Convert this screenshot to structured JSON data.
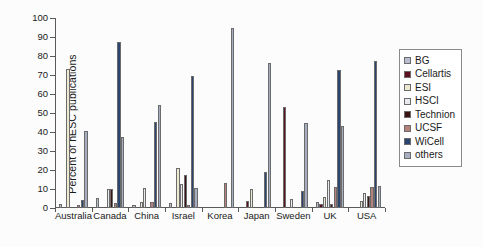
{
  "chart_data": {
    "type": "bar",
    "title": "",
    "xlabel": "",
    "ylabel": "Percent of hESC publications",
    "ylim": [
      0,
      100
    ],
    "ytick_step": 10,
    "yticks": [
      0,
      10,
      20,
      30,
      40,
      50,
      60,
      70,
      80,
      90,
      100
    ],
    "ytick_labels": [
      "0",
      "10",
      "20",
      "30",
      "40",
      "50",
      "60",
      "70",
      "80",
      "90",
      "100"
    ],
    "grid": false,
    "legend_position": "right",
    "categories": [
      "Australia",
      "Canada",
      "China",
      "Israel",
      "Korea",
      "Japan",
      "Sweden",
      "UK",
      "USA"
    ],
    "series": [
      {
        "name": "BG",
        "color": "#b9bdd0",
        "values": [
          2.0,
          5.2,
          1.5,
          2.8,
          0.0,
          0.0,
          0.0,
          3.2,
          0.0
        ]
      },
      {
        "name": "Cellartis",
        "color": "#5c1020",
        "values": [
          0.0,
          0.0,
          0.0,
          0.0,
          0.0,
          3.6,
          53.0,
          2.0,
          0.0
        ]
      },
      {
        "name": "ESI",
        "color": "#ebead0",
        "values": [
          73.0,
          0.0,
          3.0,
          21.2,
          0.0,
          10.2,
          0.0,
          6.0,
          3.5
        ]
      },
      {
        "name": "HSCI",
        "color": "#e9eaee",
        "values": [
          0.0,
          10.0,
          10.5,
          12.8,
          0.0,
          0.0,
          4.5,
          14.5,
          8.0
        ]
      },
      {
        "name": "Technion",
        "color": "#3a1412",
        "values": [
          0.0,
          10.2,
          0.0,
          17.3,
          0.0,
          0.0,
          0.0,
          2.0,
          6.2
        ]
      },
      {
        "name": "UCSF",
        "color": "#b5817c",
        "values": [
          1.7,
          2.7,
          3.0,
          1.5,
          13.3,
          0.0,
          0.0,
          10.8,
          11.2
        ]
      },
      {
        "name": "WiCell",
        "color": "#2c4470",
        "values": [
          4.0,
          87.5,
          45.2,
          69.5,
          0.0,
          19.0,
          9.0,
          72.5,
          77.5
        ]
      },
      {
        "name": "others",
        "color": "#a8aec1",
        "values": [
          40.3,
          37.5,
          54.0,
          10.5,
          94.5,
          76.5,
          44.5,
          43.0,
          11.5
        ]
      }
    ]
  },
  "legend": {
    "items": [
      {
        "label": "BG"
      },
      {
        "label": "Cellartis"
      },
      {
        "label": "ESI"
      },
      {
        "label": "HSCI"
      },
      {
        "label": "Technion"
      },
      {
        "label": "UCSF"
      },
      {
        "label": "WiCell"
      },
      {
        "label": "others"
      }
    ]
  }
}
